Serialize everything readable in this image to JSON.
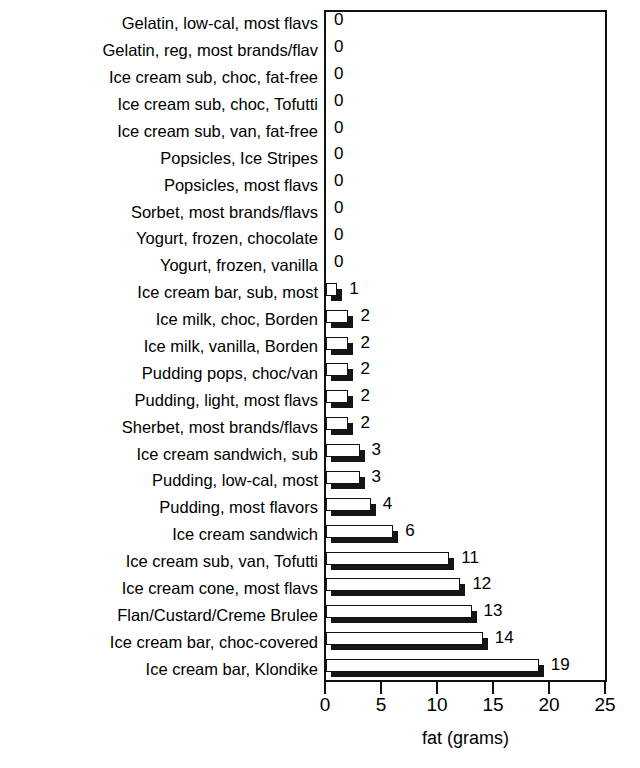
{
  "chart_data": {
    "type": "bar",
    "orientation": "horizontal",
    "title": "ICE CREAM ALTERNATIVES",
    "xlabel": "fat (grams)",
    "ylabel": "",
    "xlim": [
      0,
      25
    ],
    "xticks": [
      0,
      5,
      10,
      15,
      20,
      25
    ],
    "grid": false,
    "legend": null,
    "categories": [
      "Gelatin, low-cal, most flavs",
      "Gelatin, reg, most brands/flav",
      "Ice cream sub, choc, fat-free",
      "Ice cream sub, choc, Tofutti",
      "Ice cream sub, van, fat-free",
      "Popsicles, Ice Stripes",
      "Popsicles, most flavs",
      "Sorbet, most brands/flavs",
      "Yogurt, frozen, chocolate",
      "Yogurt, frozen, vanilla",
      "Ice cream bar, sub, most",
      "Ice milk, choc, Borden",
      "Ice milk, vanilla, Borden",
      "Pudding pops, choc/van",
      "Pudding, light, most flavs",
      "Sherbet, most brands/flavs",
      "Ice cream sandwich, sub",
      "Pudding, low-cal, most",
      "Pudding, most flavors",
      "Ice cream sandwich",
      "Ice cream sub, van, Tofutti",
      "Ice cream cone, most flavs",
      "Flan/Custard/Creme Brulee",
      "Ice cream bar, choc-covered",
      "Ice cream bar, Klondike"
    ],
    "values": [
      0,
      0,
      0,
      0,
      0,
      0,
      0,
      0,
      0,
      0,
      1,
      2,
      2,
      2,
      2,
      2,
      3,
      3,
      4,
      6,
      11,
      12,
      13,
      14,
      19
    ],
    "value_labels": [
      "0",
      "0",
      "0",
      "0",
      "0",
      "0",
      "0",
      "0",
      "0",
      "0",
      "1",
      "2",
      "2",
      "2",
      "2",
      "2",
      "3",
      "3",
      "4",
      "6",
      "11",
      "12",
      "13",
      "14",
      "19"
    ],
    "bar_style": "3d-white-face-black-shadow",
    "colors": {
      "bar_face": "#ffffff",
      "bar_shadow": "#151515",
      "outline": "#111111",
      "text": "#000000",
      "background": "#ffffff"
    }
  }
}
